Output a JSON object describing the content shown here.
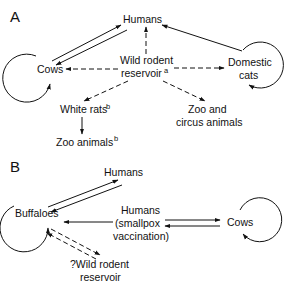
{
  "panel_a": {
    "label": "A",
    "nodes": {
      "humans": "Humans",
      "cows": "Cows",
      "reservoir_line1": "Wild rodent",
      "reservoir_line2": "reservoir",
      "reservoir_sup": "a",
      "cats_line1": "Domestic",
      "cats_line2": "cats",
      "white_rats": "White rats",
      "white_rats_sup": "b",
      "zoo_animals": "Zoo animals",
      "zoo_animals_sup": "b",
      "zoo_circus_line1": "Zoo and",
      "zoo_circus_line2": "circus animals"
    },
    "edges": [
      {
        "from": "Cows",
        "to": "Humans",
        "style": "double-solid",
        "direction": "both"
      },
      {
        "from": "Wild rodent reservoir",
        "to": "Humans",
        "style": "dashed"
      },
      {
        "from": "Wild rodent reservoir",
        "to": "Cows",
        "style": "dashed"
      },
      {
        "from": "Wild rodent reservoir",
        "to": "Domestic cats",
        "style": "dashed"
      },
      {
        "from": "Wild rodent reservoir",
        "to": "White rats",
        "style": "dashed"
      },
      {
        "from": "Wild rodent reservoir",
        "to": "Zoo and circus animals",
        "style": "dashed"
      },
      {
        "from": "White rats",
        "to": "Zoo animals",
        "style": "solid"
      },
      {
        "from": "Domestic cats",
        "to": "Humans",
        "style": "solid"
      },
      {
        "from": "Cows",
        "to": "Cows",
        "style": "self-loop"
      },
      {
        "from": "Domestic cats",
        "to": "Domestic cats",
        "style": "self-loop"
      }
    ]
  },
  "panel_b": {
    "label": "B",
    "nodes": {
      "humans_top": "Humans",
      "buffaloes": "Buffaloes",
      "humans_vacc_line1": "Humans",
      "humans_vacc_line2": "(smallpox",
      "humans_vacc_line3": "vaccination)",
      "cows": "Cows",
      "reservoir_line1": "?Wild rodent",
      "reservoir_line2": "reservoir"
    },
    "edges": [
      {
        "from": "Buffaloes",
        "to": "Humans",
        "style": "double-solid",
        "direction": "both"
      },
      {
        "from": "Humans (smallpox vaccination)",
        "to": "Buffaloes",
        "style": "solid"
      },
      {
        "from": "Humans (smallpox vaccination)",
        "to": "Cows",
        "style": "double-solid",
        "direction": "both"
      },
      {
        "from": "Buffaloes",
        "to": "?Wild rodent reservoir",
        "style": "double-dashed",
        "direction": "both"
      },
      {
        "from": "Buffaloes",
        "to": "Buffaloes",
        "style": "self-loop"
      },
      {
        "from": "Cows",
        "to": "Cows",
        "style": "self-loop"
      }
    ]
  }
}
